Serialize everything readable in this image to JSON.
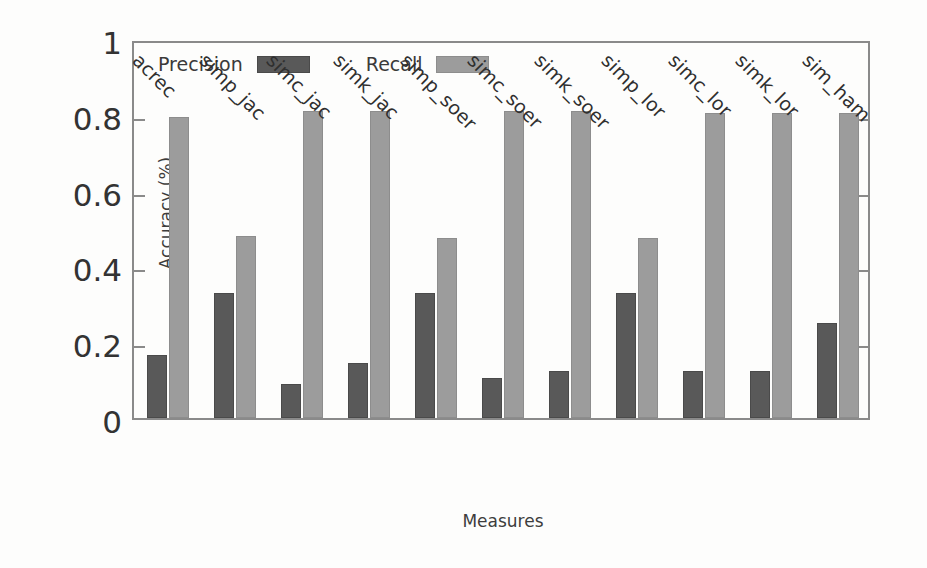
{
  "chart_data": {
    "type": "bar",
    "title": "",
    "xlabel": "Measures",
    "ylabel": "Accuracy (%)",
    "ylim": [
      0,
      1
    ],
    "yticks": [
      "0",
      "0.2",
      "0.4",
      "0.6",
      "0.8",
      "1"
    ],
    "grid": false,
    "legend_position": "top-left-inside",
    "categories": [
      "acrec",
      "simp_jac",
      "simc_jac",
      "simk_jac",
      "simp_soer",
      "simc_soer",
      "simk_soer",
      "simp_lor",
      "simc_lor",
      "simk_lor",
      "sim_ham"
    ],
    "series": [
      {
        "name": "Precision",
        "color": "#595959",
        "values": [
          0.165,
          0.33,
          0.09,
          0.145,
          0.33,
          0.105,
          0.125,
          0.33,
          0.125,
          0.125,
          0.25
        ]
      },
      {
        "name": "Recall",
        "color": "#9c9c9c",
        "values": [
          0.795,
          0.48,
          0.81,
          0.81,
          0.475,
          0.81,
          0.81,
          0.475,
          0.805,
          0.805,
          0.805
        ]
      }
    ]
  }
}
